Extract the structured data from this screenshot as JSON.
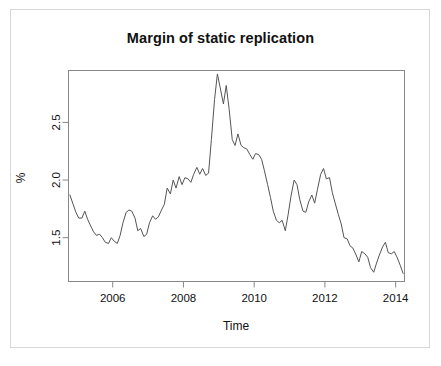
{
  "chart_data": {
    "type": "line",
    "title": "Margin of static replication",
    "xlabel": "Time",
    "ylabel": "%",
    "xlim": [
      2004.75,
      2014.25
    ],
    "ylim": [
      1.12,
      2.95
    ],
    "grid": false,
    "legend": null,
    "xticks": [
      2006,
      2008,
      2010,
      2012,
      2014
    ],
    "xtick_labels": [
      "2006",
      "2008",
      "2010",
      "2012",
      "2014"
    ],
    "yticks": [
      1.5,
      2.0,
      2.5
    ],
    "ytick_labels": [
      "1.5",
      "2.0",
      "2.5"
    ],
    "line_color": "#555555",
    "series": [
      {
        "name": "Margin of static replication",
        "x": [
          2004.79,
          2004.88,
          2004.96,
          2005.04,
          2005.13,
          2005.21,
          2005.29,
          2005.38,
          2005.46,
          2005.54,
          2005.63,
          2005.71,
          2005.79,
          2005.88,
          2005.96,
          2006.04,
          2006.13,
          2006.21,
          2006.29,
          2006.38,
          2006.46,
          2006.54,
          2006.63,
          2006.71,
          2006.79,
          2006.88,
          2006.96,
          2007.04,
          2007.13,
          2007.21,
          2007.29,
          2007.38,
          2007.46,
          2007.54,
          2007.63,
          2007.71,
          2007.79,
          2007.88,
          2007.96,
          2008.04,
          2008.13,
          2008.21,
          2008.29,
          2008.38,
          2008.46,
          2008.54,
          2008.63,
          2008.71,
          2008.79,
          2008.88,
          2008.96,
          2009.04,
          2009.13,
          2009.21,
          2009.29,
          2009.38,
          2009.46,
          2009.54,
          2009.63,
          2009.71,
          2009.79,
          2009.88,
          2009.96,
          2010.04,
          2010.13,
          2010.21,
          2010.29,
          2010.38,
          2010.46,
          2010.54,
          2010.63,
          2010.71,
          2010.79,
          2010.88,
          2010.96,
          2011.04,
          2011.13,
          2011.21,
          2011.29,
          2011.38,
          2011.46,
          2011.54,
          2011.63,
          2011.71,
          2011.79,
          2011.88,
          2011.96,
          2012.04,
          2012.13,
          2012.21,
          2012.29,
          2012.38,
          2012.46,
          2012.54,
          2012.63,
          2012.71,
          2012.79,
          2012.88,
          2012.96,
          2013.04,
          2013.13,
          2013.21,
          2013.29,
          2013.38,
          2013.46,
          2013.54,
          2013.63,
          2013.71,
          2013.79,
          2013.88,
          2013.96,
          2014.04,
          2014.13,
          2014.21
        ],
        "y": [
          1.87,
          1.79,
          1.72,
          1.67,
          1.67,
          1.73,
          1.66,
          1.6,
          1.55,
          1.52,
          1.53,
          1.5,
          1.46,
          1.45,
          1.5,
          1.47,
          1.45,
          1.52,
          1.63,
          1.72,
          1.74,
          1.73,
          1.67,
          1.56,
          1.58,
          1.51,
          1.53,
          1.63,
          1.69,
          1.66,
          1.68,
          1.74,
          1.79,
          1.93,
          1.88,
          2.0,
          1.93,
          2.03,
          1.96,
          2.02,
          2.01,
          1.98,
          2.05,
          2.11,
          2.05,
          2.1,
          2.04,
          2.06,
          2.35,
          2.7,
          2.92,
          2.8,
          2.66,
          2.82,
          2.62,
          2.35,
          2.3,
          2.4,
          2.3,
          2.28,
          2.27,
          2.22,
          2.18,
          2.23,
          2.22,
          2.18,
          2.08,
          1.96,
          1.85,
          1.73,
          1.65,
          1.63,
          1.65,
          1.56,
          1.7,
          1.86,
          2.0,
          1.96,
          1.83,
          1.73,
          1.72,
          1.81,
          1.87,
          1.8,
          1.92,
          2.05,
          2.1,
          2.01,
          2.02,
          1.89,
          1.8,
          1.7,
          1.62,
          1.5,
          1.49,
          1.43,
          1.41,
          1.35,
          1.29,
          1.38,
          1.36,
          1.33,
          1.24,
          1.2,
          1.28,
          1.35,
          1.42,
          1.46,
          1.37,
          1.36,
          1.38,
          1.33,
          1.26,
          1.19
        ]
      }
    ]
  },
  "figure": {
    "background": "#ffffff",
    "frame_color": "#d8d8d8",
    "axis_color": "#888888"
  }
}
